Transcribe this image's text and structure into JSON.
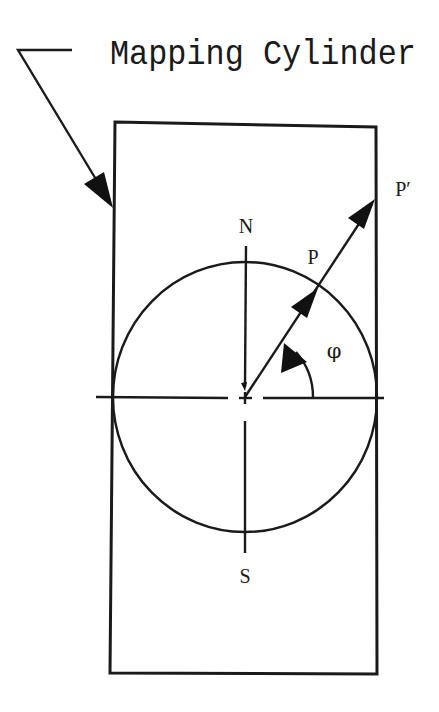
{
  "diagram": {
    "title": "Mapping Cylinder",
    "labels": {
      "north": "N",
      "south": "S",
      "point_on_sphere": "P",
      "projected_point": "P′",
      "angle": "φ"
    },
    "elements": {
      "cylinder": "rectangle representing the mapping cylinder (side view)",
      "sphere": "circle inscribed in cylinder, tangent at equator",
      "polar_axis": "vertical N–S axis through center",
      "equator_line": "horizontal line through center",
      "projection_ray": "ray from center through P on circle to P′ on cylinder wall",
      "latitude_angle": "angle φ between equator and projection ray",
      "leader_arrow": "arrow from title pointing to cylinder wall"
    },
    "colors": {
      "ink": "#1a1a1a",
      "paper": "#ffffff"
    }
  }
}
